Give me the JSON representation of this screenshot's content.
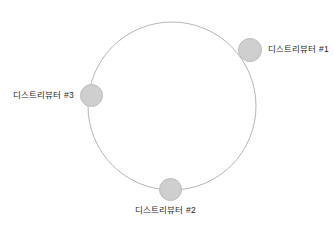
{
  "diagram": {
    "type": "ring-topology",
    "background_color": "#ffffff",
    "ring": {
      "center_x": 172,
      "center_y": 106,
      "radius": 84,
      "stroke_color": "#b5b5b5",
      "stroke_width": 1,
      "fill": "none"
    },
    "node_style": {
      "fill_color": "#cfcfcf",
      "border_color": "#bcbcbc",
      "diameter": 24
    },
    "label_color": "#1e1e1e",
    "nodes": [
      {
        "id": "node-1",
        "label": "디스트리뷰터 #1",
        "x": 250,
        "y": 50,
        "label_position": "right"
      },
      {
        "id": "node-2",
        "label": "디스트리뷰터 #2",
        "x": 170,
        "y": 190,
        "label_position": "bottom"
      },
      {
        "id": "node-3",
        "label": "디스트리뷰터 #3",
        "x": 91,
        "y": 95,
        "label_position": "left"
      }
    ]
  }
}
